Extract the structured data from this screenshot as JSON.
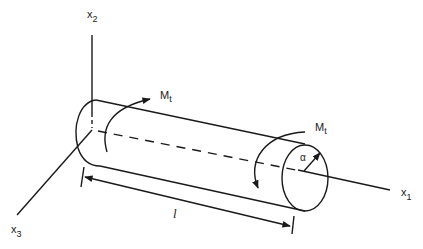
{
  "diagram": {
    "type": "cylinder-torsion",
    "axes": {
      "x1": {
        "label": "x",
        "sub": "1"
      },
      "x2": {
        "label": "x",
        "sub": "2"
      },
      "x3": {
        "label": "x",
        "sub": "3"
      }
    },
    "moments": {
      "left": {
        "label": "M",
        "sub": "t"
      },
      "right": {
        "label": "M",
        "sub": "t"
      }
    },
    "radius_label": "α",
    "length_label": "l",
    "colors": {
      "stroke": "#1a1a1a",
      "background": "#ffffff"
    }
  }
}
